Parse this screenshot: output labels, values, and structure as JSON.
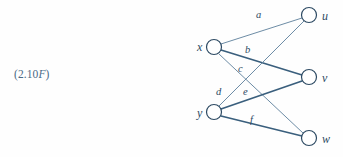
{
  "figure": {
    "tag_prefix": "(2.10",
    "tag_italic": "F",
    "tag_suffix": ")",
    "tag_full": "(2.10F)"
  },
  "colors": {
    "edge_stroke": "#3a5f7d",
    "edge_stroke_thin": "#5c7f9b",
    "node_stroke": "#2d4a63",
    "node_fill": "#ffffff",
    "label_text": "#2d4a63",
    "tag_text": "#4a6a86",
    "background": "#fefefe"
  },
  "graph": {
    "type": "bipartite-graph",
    "left_nodes": [
      {
        "id": "x",
        "label": "x",
        "cx": 214,
        "cy": 47,
        "r": 7.5,
        "label_x": 197,
        "label_y": 51
      },
      {
        "id": "y",
        "label": "y",
        "cx": 214,
        "cy": 112,
        "r": 7.5,
        "label_x": 197,
        "label_y": 117
      }
    ],
    "right_nodes": [
      {
        "id": "u",
        "label": "u",
        "cx": 309,
        "cy": 15,
        "r": 7.5,
        "label_x": 322,
        "label_y": 20
      },
      {
        "id": "v",
        "label": "v",
        "cx": 309,
        "cy": 77,
        "r": 7.5,
        "label_x": 322,
        "label_y": 82
      },
      {
        "id": "w",
        "label": "w",
        "cx": 309,
        "cy": 138,
        "r": 7.5,
        "label_x": 322,
        "label_y": 143
      }
    ],
    "edges": [
      {
        "id": "a",
        "label": "a",
        "from": "x",
        "to": "u",
        "x1": 221,
        "y1": 44,
        "x2": 302,
        "y2": 18,
        "width": 0.9,
        "label_x": 256,
        "label_y": 18
      },
      {
        "id": "b",
        "label": "b",
        "from": "x",
        "to": "v",
        "x1": 221,
        "y1": 50,
        "x2": 302,
        "y2": 75,
        "width": 1.7,
        "label_x": 245,
        "label_y": 53
      },
      {
        "id": "c",
        "label": "c",
        "from": "x",
        "to": "w",
        "x1": 219,
        "y1": 54,
        "x2": 303,
        "y2": 133,
        "width": 0.9,
        "label_x": 238,
        "label_y": 72
      },
      {
        "id": "d",
        "label": "d",
        "from": "y",
        "to": "u",
        "x1": 219,
        "y1": 106,
        "x2": 304,
        "y2": 21,
        "width": 0.9,
        "label_x": 216,
        "label_y": 95
      },
      {
        "id": "e",
        "label": "e",
        "from": "y",
        "to": "v",
        "x1": 221,
        "y1": 109,
        "x2": 302,
        "y2": 81,
        "width": 1.7,
        "label_x": 243,
        "label_y": 95
      },
      {
        "id": "f",
        "label": "f",
        "from": "y",
        "to": "w",
        "x1": 221,
        "y1": 116,
        "x2": 302,
        "y2": 136,
        "width": 1.7,
        "label_x": 250,
        "label_y": 123
      }
    ]
  }
}
